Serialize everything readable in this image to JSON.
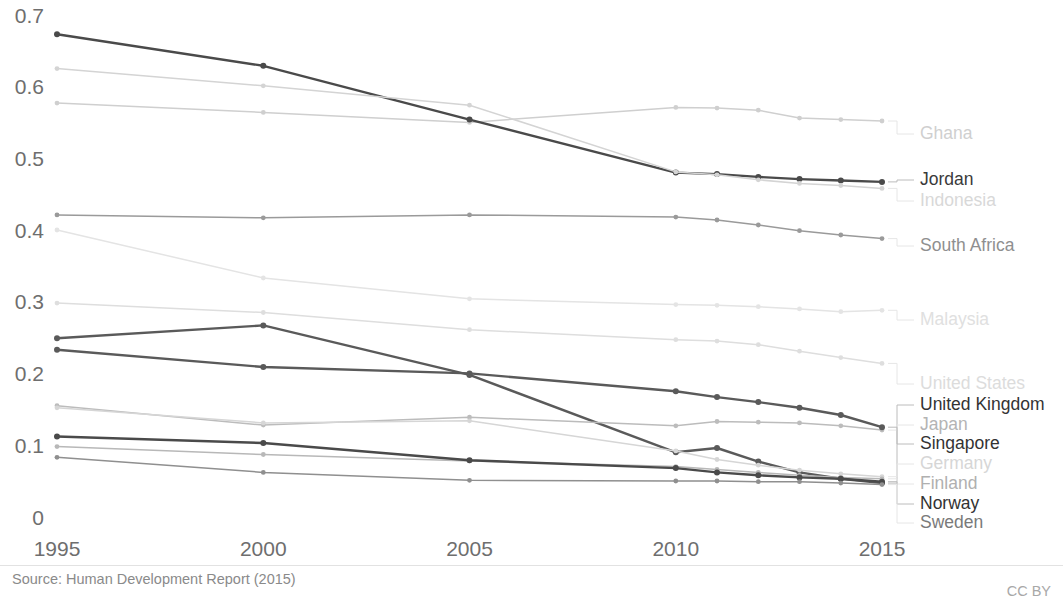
{
  "footer": {
    "source": "Source: Human Development Report (2015)",
    "license": "CC BY"
  },
  "axes": {
    "y_ticks": [
      "0",
      "0.1",
      "0.2",
      "0.3",
      "0.4",
      "0.5",
      "0.6",
      "0.7"
    ],
    "x_ticks": [
      "1995",
      "2000",
      "2005",
      "2010",
      "2015"
    ]
  },
  "chart_data": {
    "type": "line",
    "title": "",
    "subtitle": "",
    "xlabel": "",
    "ylabel": "",
    "xlim": [
      1995,
      2015
    ],
    "ylim": [
      0,
      0.7
    ],
    "grid": false,
    "legend_position": "right-direct-labels",
    "x": [
      1995,
      2000,
      2005,
      2010,
      2011,
      2012,
      2013,
      2014,
      2015
    ],
    "series": [
      {
        "name": "Ghana",
        "highlighted": false,
        "color": "#cfcfcf",
        "label_color": "#cfcfcf",
        "label_y": 134,
        "values": [
          0.58,
          0.567,
          0.553,
          0.574,
          0.573,
          0.57,
          0.559,
          0.557,
          0.555
        ]
      },
      {
        "name": "Jordan",
        "highlighted": true,
        "color": "#4a4a4a",
        "label_color": "#3a3a3a",
        "label_y": 180,
        "values": [
          0.676,
          0.632,
          0.557,
          0.483,
          0.481,
          0.477,
          0.474,
          0.472,
          0.47
        ]
      },
      {
        "name": "Indonesia",
        "highlighted": false,
        "color": "#d4d4d4",
        "label_color": "#d8d8d8",
        "label_y": 201,
        "values": [
          0.628,
          0.604,
          0.577,
          0.484,
          0.48,
          0.473,
          0.468,
          0.465,
          0.461
        ]
      },
      {
        "name": "South Africa",
        "highlighted": false,
        "color": "#9a9a9a",
        "label_color": "#8f8f8f",
        "label_y": 246,
        "values": [
          0.424,
          0.42,
          0.424,
          0.421,
          0.417,
          0.41,
          0.402,
          0.396,
          0.391
        ]
      },
      {
        "name": "Malaysia",
        "highlighted": false,
        "color": "#e4e4e4",
        "label_color": "#e0e0e0",
        "label_y": 320,
        "values": [
          0.403,
          0.336,
          0.307,
          0.299,
          0.298,
          0.296,
          0.293,
          0.289,
          0.291
        ]
      },
      {
        "name": "United States",
        "highlighted": false,
        "color": "#dedede",
        "label_color": "#dcdcdc",
        "label_y": 384,
        "values": [
          0.301,
          0.288,
          0.264,
          0.25,
          0.248,
          0.243,
          0.234,
          0.225,
          0.217
        ]
      },
      {
        "name": "United Kingdom",
        "highlighted": true,
        "color": "#5a5a5a",
        "label_color": "#333333",
        "label_y": 405,
        "values": [
          0.252,
          0.27,
          0.201,
          0.093,
          0.099,
          0.08,
          0.065,
          0.056,
          0.05
        ]
      },
      {
        "name": "Japan",
        "highlighted": false,
        "color": "#bcbcbc",
        "label_color": "#b4b4b4",
        "label_y": 425,
        "values": [
          0.158,
          0.131,
          0.142,
          0.13,
          0.136,
          0.135,
          0.134,
          0.13,
          0.124
        ]
      },
      {
        "name": "Singapore",
        "highlighted": true,
        "color": "#5a5a5a",
        "label_color": "#333333",
        "label_y": 444,
        "values": [
          0.236,
          0.212,
          0.203,
          0.178,
          0.17,
          0.163,
          0.155,
          0.145,
          0.128
        ]
      },
      {
        "name": "Germany",
        "highlighted": false,
        "color": "#d6d6d6",
        "label_color": "#d6d6d6",
        "label_y": 464,
        "values": [
          0.155,
          0.134,
          0.137,
          0.095,
          0.083,
          0.075,
          0.068,
          0.063,
          0.059
        ]
      },
      {
        "name": "Finland",
        "highlighted": false,
        "color": "#b8b8b8",
        "label_color": "#b0b0b0",
        "label_y": 484,
        "values": [
          0.101,
          0.09,
          0.081,
          0.073,
          0.069,
          0.065,
          0.061,
          0.058,
          0.056
        ]
      },
      {
        "name": "Norway",
        "highlighted": true,
        "color": "#4a4a4a",
        "label_color": "#333333",
        "label_y": 504,
        "values": [
          0.115,
          0.106,
          0.082,
          0.071,
          0.065,
          0.061,
          0.058,
          0.056,
          0.052
        ]
      },
      {
        "name": "Sweden",
        "highlighted": false,
        "color": "#8f8f8f",
        "label_color": "#7a7a7a",
        "label_y": 523,
        "values": [
          0.086,
          0.065,
          0.054,
          0.053,
          0.053,
          0.052,
          0.052,
          0.05,
          0.048
        ]
      }
    ]
  }
}
